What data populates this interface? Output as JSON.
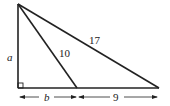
{
  "diagram": {
    "type": "right-triangle-with-cevian",
    "labels": {
      "left_side": "a",
      "cevian": "10",
      "hypotenuse": "17",
      "base_left": "b",
      "base_right": "9"
    },
    "right_angle_marker": true,
    "colors": {
      "stroke": "#222222",
      "background": "#ffffff"
    }
  }
}
